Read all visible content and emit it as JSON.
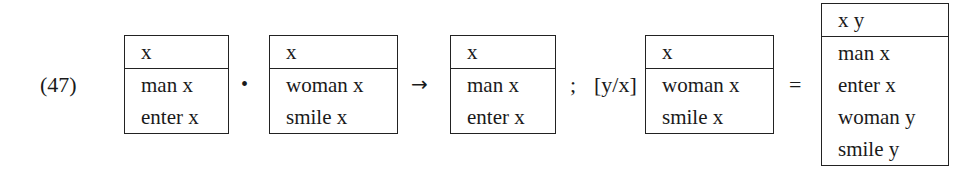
{
  "example_number": "(47)",
  "operators": {
    "merge": "•",
    "arrow": "→",
    "semicolon": ";",
    "substitution": "[y/x]",
    "equals": "="
  },
  "boxes": [
    {
      "universe": "x",
      "conditions": [
        "man x",
        "enter x"
      ]
    },
    {
      "universe": "x",
      "conditions": [
        "woman x",
        "smile x"
      ]
    },
    {
      "universe": "x",
      "conditions": [
        "man x",
        "enter x"
      ]
    },
    {
      "universe": "x",
      "conditions": [
        "woman x",
        "smile x"
      ]
    },
    {
      "universe": "x y",
      "conditions": [
        "man x",
        "enter x",
        "woman y",
        "smile y"
      ]
    }
  ]
}
